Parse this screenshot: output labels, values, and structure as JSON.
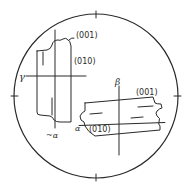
{
  "figure": {
    "type": "crystal orientation diagram in circular field of view",
    "field_of_view": {
      "shape": "circle",
      "tick_marks": [
        "top",
        "right",
        "bottom",
        "left"
      ]
    },
    "crystals": [
      {
        "position": "upper-left",
        "orientation": "vertical",
        "face_labels": {
          "top": "(001)",
          "side": "(010)"
        },
        "axis_labels": {
          "horizontal": "γ",
          "vertical": "~α"
        }
      },
      {
        "position": "lower-right",
        "orientation": "horizontal (slightly tilted)",
        "face_labels": {
          "top": "(001)",
          "bottom": "(010)"
        },
        "axis_labels": {
          "vertical": "β",
          "horizontal": "α"
        }
      }
    ]
  },
  "labels": {
    "left_001": "(001)",
    "left_010": "(010)",
    "gamma": "γ",
    "approx_alpha": "~α",
    "beta": "β",
    "right_001": "(001)",
    "alpha": "α",
    "right_010": "(010)"
  },
  "colors": {
    "ink": "#2a2a2a",
    "background": "#ffffff"
  }
}
